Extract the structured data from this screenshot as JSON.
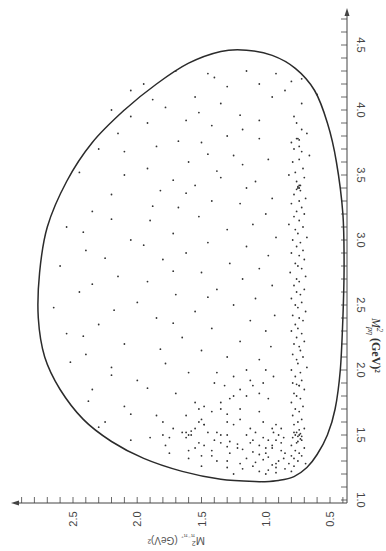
{
  "chart_data": {
    "type": "scatter",
    "title": "",
    "subtitle": "Dalitz plot (figure rotated 90°)",
    "xlabel": "M²_pη (GeV)²",
    "ylabel": "M²_π⁻π⁺ (GeV)²",
    "xlabel_display": "M",
    "xlabel_sup": "2",
    "xlabel_sub": "pη",
    "xlabel_unit": "(GeV)²",
    "ylabel_display": "M",
    "ylabel_sup": "2",
    "ylabel_sub": "π⁻π⁺",
    "ylabel_unit": "(GeV)²",
    "x_axis": {
      "min": 1.0,
      "max": 4.6,
      "ticks": [
        "1.0",
        "1.5",
        "2.0",
        "2.5",
        "3.0",
        "3.5",
        "4.0",
        "4.5"
      ],
      "tick_values": [
        1.0,
        1.5,
        2.0,
        2.5,
        3.0,
        3.5,
        4.0,
        4.5
      ],
      "minor_step": 0.1
    },
    "y_axis": {
      "min": 0.38,
      "max": 2.9,
      "ticks": [
        "0.5",
        "1.0",
        "1.5",
        "2.0",
        "2.5"
      ],
      "tick_values": [
        0.5,
        1.0,
        1.5,
        2.0,
        2.5
      ],
      "minor_step": 0.1
    },
    "grid": false,
    "legend": null,
    "annotations": [
      "Kinematic boundary curve",
      "Dense band near M²_π⁻π⁺ ≈ 0.75 (ρ⁰)",
      "Enhancement near M²_pη ≈ 1.5"
    ],
    "boundary": [
      [
        1.14,
        1.03
      ],
      [
        1.15,
        0.9
      ],
      [
        1.18,
        0.78
      ],
      [
        1.25,
        0.68
      ],
      [
        1.35,
        0.6
      ],
      [
        1.5,
        0.52
      ],
      [
        1.7,
        0.46
      ],
      [
        2.0,
        0.42
      ],
      [
        2.4,
        0.4
      ],
      [
        2.8,
        0.39
      ],
      [
        3.2,
        0.4
      ],
      [
        3.6,
        0.45
      ],
      [
        3.9,
        0.52
      ],
      [
        4.15,
        0.62
      ],
      [
        4.32,
        0.77
      ],
      [
        4.42,
        0.95
      ],
      [
        4.46,
        1.15
      ],
      [
        4.45,
        1.35
      ],
      [
        4.36,
        1.6
      ],
      [
        4.2,
        1.85
      ],
      [
        4.0,
        2.1
      ],
      [
        3.75,
        2.35
      ],
      [
        3.45,
        2.55
      ],
      [
        3.1,
        2.7
      ],
      [
        2.75,
        2.76
      ],
      [
        2.4,
        2.77
      ],
      [
        2.1,
        2.72
      ],
      [
        1.85,
        2.6
      ],
      [
        1.62,
        2.42
      ],
      [
        1.45,
        2.2
      ],
      [
        1.32,
        1.95
      ],
      [
        1.22,
        1.65
      ],
      [
        1.16,
        1.35
      ],
      [
        1.14,
        1.03
      ]
    ],
    "points": [
      [
        4.28,
        0.92
      ],
      [
        4.24,
        0.72
      ],
      [
        4.22,
        0.8
      ],
      [
        4.12,
        0.6
      ],
      [
        4.2,
        1.05
      ],
      [
        4.15,
        0.85
      ],
      [
        4.1,
        0.95
      ],
      [
        4.05,
        0.72
      ],
      [
        4.3,
        1.15
      ],
      [
        4.18,
        1.3
      ],
      [
        4.28,
        1.45
      ],
      [
        4.1,
        1.55
      ],
      [
        4.02,
        1.78
      ],
      [
        3.96,
        1.2
      ],
      [
        3.92,
        1.05
      ],
      [
        3.95,
        0.78
      ],
      [
        3.9,
        0.76
      ],
      [
        3.85,
        0.72
      ],
      [
        3.82,
        0.68
      ],
      [
        3.78,
        0.75
      ],
      [
        3.75,
        0.8
      ],
      [
        3.72,
        0.74
      ],
      [
        3.7,
        0.78
      ],
      [
        3.68,
        0.72
      ],
      [
        3.65,
        0.66
      ],
      [
        3.62,
        0.74
      ],
      [
        3.6,
        0.79
      ],
      [
        3.55,
        0.71
      ],
      [
        3.52,
        0.77
      ],
      [
        3.5,
        0.82
      ],
      [
        3.48,
        0.7
      ],
      [
        3.45,
        0.76
      ],
      [
        3.42,
        0.74
      ],
      [
        3.4,
        0.75
      ],
      [
        3.38,
        0.73
      ],
      [
        3.35,
        0.78
      ],
      [
        3.32,
        0.69
      ],
      [
        3.3,
        0.74
      ],
      [
        3.28,
        0.8
      ],
      [
        3.25,
        0.72
      ],
      [
        3.22,
        0.76
      ],
      [
        3.2,
        0.7
      ],
      [
        3.18,
        0.78
      ],
      [
        3.15,
        0.74
      ],
      [
        3.12,
        0.82
      ],
      [
        3.1,
        0.71
      ],
      [
        3.08,
        0.77
      ],
      [
        3.05,
        0.75
      ],
      [
        3.02,
        0.68
      ],
      [
        3.0,
        0.79
      ],
      [
        2.98,
        0.73
      ],
      [
        2.95,
        0.76
      ],
      [
        2.92,
        0.71
      ],
      [
        2.9,
        0.8
      ],
      [
        2.88,
        0.74
      ],
      [
        2.85,
        0.7
      ],
      [
        2.82,
        0.77
      ],
      [
        2.8,
        0.75
      ],
      [
        2.78,
        0.72
      ],
      [
        2.75,
        0.81
      ],
      [
        2.72,
        0.69
      ],
      [
        2.7,
        0.76
      ],
      [
        2.68,
        0.74
      ],
      [
        2.65,
        0.78
      ],
      [
        2.62,
        0.7
      ],
      [
        2.6,
        0.76
      ],
      [
        2.58,
        0.73
      ],
      [
        2.55,
        0.8
      ],
      [
        2.52,
        0.72
      ],
      [
        2.5,
        0.77
      ],
      [
        2.48,
        0.75
      ],
      [
        2.45,
        0.69
      ],
      [
        2.42,
        0.79
      ],
      [
        2.4,
        0.74
      ],
      [
        2.38,
        0.71
      ],
      [
        2.35,
        0.77
      ],
      [
        2.32,
        0.75
      ],
      [
        2.3,
        0.8
      ],
      [
        2.28,
        0.72
      ],
      [
        2.25,
        0.76
      ],
      [
        2.22,
        0.7
      ],
      [
        2.2,
        0.78
      ],
      [
        2.18,
        0.74
      ],
      [
        2.15,
        0.73
      ],
      [
        2.12,
        0.79
      ],
      [
        2.1,
        0.71
      ],
      [
        2.08,
        0.76
      ],
      [
        2.05,
        0.75
      ],
      [
        2.02,
        0.68
      ],
      [
        2.0,
        0.8
      ],
      [
        1.98,
        0.73
      ],
      [
        1.95,
        0.77
      ],
      [
        1.92,
        0.72
      ],
      [
        1.9,
        0.79
      ],
      [
        1.88,
        0.74
      ],
      [
        1.85,
        0.7
      ],
      [
        1.82,
        0.78
      ],
      [
        1.8,
        0.76
      ],
      [
        1.78,
        0.73
      ],
      [
        1.75,
        0.8
      ],
      [
        1.72,
        0.71
      ],
      [
        1.7,
        0.77
      ],
      [
        1.68,
        0.74
      ],
      [
        1.65,
        0.79
      ],
      [
        1.62,
        0.72
      ],
      [
        1.6,
        0.75
      ],
      [
        1.58,
        0.78
      ],
      [
        1.55,
        0.7
      ],
      [
        1.52,
        0.76
      ],
      [
        1.5,
        0.74
      ],
      [
        1.5,
        0.77
      ],
      [
        1.49,
        0.75
      ],
      [
        1.51,
        0.73
      ],
      [
        1.48,
        0.79
      ],
      [
        1.46,
        0.72
      ],
      [
        1.44,
        0.76
      ],
      [
        1.42,
        0.8
      ],
      [
        1.4,
        0.7
      ],
      [
        1.38,
        0.77
      ],
      [
        1.36,
        0.74
      ],
      [
        1.34,
        0.72
      ],
      [
        1.32,
        0.78
      ],
      [
        1.3,
        0.75
      ],
      [
        1.28,
        0.69
      ],
      [
        3.4,
        0.74
      ],
      [
        3.41,
        0.75
      ],
      [
        3.39,
        0.76
      ],
      [
        3.77,
        0.74
      ],
      [
        3.78,
        0.76
      ],
      [
        3.42,
        0.73
      ],
      [
        1.88,
        0.74
      ],
      [
        1.89,
        0.76
      ],
      [
        4.3,
        1.7
      ],
      [
        4.25,
        1.4
      ],
      [
        4.2,
        1.95
      ],
      [
        4.15,
        2.05
      ],
      [
        4.08,
        1.88
      ],
      [
        4.0,
        2.2
      ],
      [
        3.95,
        2.05
      ],
      [
        3.92,
        1.62
      ],
      [
        3.88,
        1.42
      ],
      [
        3.85,
        1.18
      ],
      [
        3.8,
        1.3
      ],
      [
        3.78,
        1.05
      ],
      [
        3.75,
        1.5
      ],
      [
        3.72,
        1.85
      ],
      [
        3.7,
        2.3
      ],
      [
        3.68,
        2.1
      ],
      [
        3.65,
        1.25
      ],
      [
        3.62,
        0.98
      ],
      [
        3.6,
        1.6
      ],
      [
        3.55,
        1.92
      ],
      [
        3.52,
        2.45
      ],
      [
        3.5,
        2.1
      ],
      [
        3.48,
        1.35
      ],
      [
        3.45,
        1.08
      ],
      [
        3.42,
        1.55
      ],
      [
        3.4,
        1.15
      ],
      [
        3.38,
        1.82
      ],
      [
        3.35,
        2.2
      ],
      [
        3.32,
        0.95
      ],
      [
        3.3,
        1.42
      ],
      [
        3.28,
        1.2
      ],
      [
        3.25,
        1.68
      ],
      [
        3.22,
        2.35
      ],
      [
        3.2,
        1.0
      ],
      [
        3.18,
        1.52
      ],
      [
        3.15,
        1.9
      ],
      [
        3.12,
        1.1
      ],
      [
        3.1,
        2.55
      ],
      [
        3.08,
        1.3
      ],
      [
        3.05,
        1.72
      ],
      [
        3.02,
        0.92
      ],
      [
        3.0,
        2.05
      ],
      [
        2.98,
        1.45
      ],
      [
        2.95,
        1.15
      ],
      [
        2.92,
        2.4
      ],
      [
        2.9,
        1.62
      ],
      [
        2.88,
        0.98
      ],
      [
        2.85,
        1.8
      ],
      [
        2.82,
        1.28
      ],
      [
        2.8,
        2.6
      ],
      [
        2.78,
        1.05
      ],
      [
        2.75,
        1.5
      ],
      [
        2.72,
        2.15
      ],
      [
        2.7,
        1.18
      ],
      [
        2.68,
        1.92
      ],
      [
        2.65,
        0.95
      ],
      [
        2.62,
        1.38
      ],
      [
        2.6,
        2.45
      ],
      [
        2.58,
        1.7
      ],
      [
        2.55,
        1.08
      ],
      [
        2.52,
        2.0
      ],
      [
        2.5,
        1.25
      ],
      [
        2.48,
        2.65
      ],
      [
        2.45,
        1.55
      ],
      [
        2.42,
        0.93
      ],
      [
        2.4,
        1.85
      ],
      [
        2.38,
        1.12
      ],
      [
        2.35,
        2.3
      ],
      [
        2.32,
        1.42
      ],
      [
        2.3,
        1.0
      ],
      [
        2.28,
        2.55
      ],
      [
        2.25,
        1.65
      ],
      [
        2.22,
        1.2
      ],
      [
        2.2,
        2.1
      ],
      [
        2.18,
        0.96
      ],
      [
        2.15,
        1.5
      ],
      [
        2.12,
        2.4
      ],
      [
        2.1,
        1.3
      ],
      [
        2.08,
        1.05
      ],
      [
        2.05,
        1.78
      ],
      [
        2.02,
        2.2
      ],
      [
        2.0,
        1.15
      ],
      [
        1.98,
        1.6
      ],
      [
        1.95,
        0.94
      ],
      [
        1.92,
        2.0
      ],
      [
        1.9,
        1.4
      ],
      [
        1.88,
        1.1
      ],
      [
        1.85,
        2.35
      ],
      [
        1.82,
        1.7
      ],
      [
        1.8,
        1.25
      ],
      [
        1.78,
        0.98
      ],
      [
        1.75,
        1.55
      ],
      [
        1.72,
        2.1
      ],
      [
        1.7,
        1.35
      ],
      [
        1.68,
        1.05
      ],
      [
        1.65,
        1.85
      ],
      [
        1.62,
        1.2
      ],
      [
        1.6,
        2.25
      ],
      [
        1.58,
        1.48
      ],
      [
        1.55,
        0.95
      ],
      [
        1.52,
        1.65
      ],
      [
        1.5,
        1.3
      ],
      [
        1.48,
        1.9
      ],
      [
        1.46,
        1.1
      ],
      [
        1.44,
        1.52
      ],
      [
        1.42,
        1.78
      ],
      [
        1.4,
        1.22
      ],
      [
        1.38,
        1.6
      ],
      [
        1.36,
        1.0
      ],
      [
        1.34,
        1.42
      ],
      [
        1.32,
        1.15
      ],
      [
        1.3,
        1.3
      ],
      [
        1.28,
        0.92
      ],
      [
        1.62,
        1.5
      ],
      [
        1.6,
        1.52
      ],
      [
        1.58,
        1.48
      ],
      [
        1.55,
        1.55
      ],
      [
        1.52,
        1.45
      ],
      [
        1.5,
        1.58
      ],
      [
        1.48,
        1.62
      ],
      [
        1.46,
        1.4
      ],
      [
        1.44,
        1.35
      ],
      [
        1.42,
        1.48
      ],
      [
        1.4,
        1.55
      ],
      [
        1.38,
        1.42
      ],
      [
        1.36,
        1.28
      ],
      [
        1.34,
        1.5
      ],
      [
        1.32,
        1.6
      ],
      [
        1.3,
        1.38
      ],
      [
        1.28,
        1.2
      ],
      [
        1.26,
        1.1
      ],
      [
        1.25,
        1.3
      ],
      [
        1.24,
        1.18
      ],
      [
        1.22,
        1.05
      ],
      [
        1.6,
        1.3
      ],
      [
        1.58,
        1.25
      ],
      [
        1.55,
        1.12
      ],
      [
        1.52,
        1.08
      ],
      [
        1.5,
        1.15
      ],
      [
        1.48,
        1.02
      ],
      [
        1.46,
        0.98
      ],
      [
        1.44,
        1.12
      ],
      [
        1.42,
        1.05
      ],
      [
        1.4,
        0.95
      ],
      [
        1.38,
        0.88
      ],
      [
        1.36,
        0.85
      ],
      [
        1.34,
        0.8
      ],
      [
        1.32,
        0.86
      ],
      [
        1.3,
        0.9
      ],
      [
        1.28,
        0.82
      ],
      [
        1.26,
        0.78
      ],
      [
        1.24,
        0.85
      ],
      [
        1.22,
        0.8
      ],
      [
        1.6,
        1.02
      ],
      [
        1.58,
        0.92
      ],
      [
        1.55,
        0.88
      ],
      [
        1.52,
        0.94
      ],
      [
        1.5,
        0.9
      ],
      [
        1.48,
        0.86
      ],
      [
        1.46,
        0.92
      ],
      [
        1.44,
        0.88
      ],
      [
        1.42,
        0.95
      ],
      [
        1.4,
        1.0
      ],
      [
        1.5,
        1.35
      ],
      [
        1.52,
        1.38
      ],
      [
        1.48,
        1.75
      ],
      [
        1.5,
        1.8
      ],
      [
        1.55,
        1.72
      ],
      [
        1.6,
        1.8
      ],
      [
        1.65,
        1.62
      ],
      [
        1.7,
        1.52
      ],
      [
        1.72,
        1.48
      ],
      [
        1.68,
        1.42
      ],
      [
        1.66,
        1.3
      ],
      [
        1.7,
        1.2
      ],
      [
        1.75,
        1.35
      ],
      [
        1.78,
        1.28
      ],
      [
        1.8,
        1.15
      ],
      [
        1.82,
        1.05
      ],
      [
        1.85,
        1.2
      ],
      [
        1.88,
        1.32
      ],
      [
        1.9,
        1.02
      ],
      [
        1.92,
        1.12
      ],
      [
        1.95,
        1.25
      ],
      [
        1.98,
        1.38
      ],
      [
        2.0,
        1.0
      ],
      [
        1.45,
        1.28
      ],
      [
        1.43,
        1.22
      ],
      [
        1.41,
        1.3
      ],
      [
        1.39,
        1.18
      ],
      [
        1.37,
        1.1
      ],
      [
        1.35,
        1.05
      ],
      [
        1.33,
        0.98
      ],
      [
        1.31,
        1.02
      ],
      [
        1.29,
        1.08
      ],
      [
        1.27,
        0.95
      ],
      [
        1.25,
        0.92
      ],
      [
        1.23,
        0.98
      ],
      [
        1.21,
        0.92
      ],
      [
        1.2,
        1.0
      ],
      [
        1.5,
        1.6
      ],
      [
        1.52,
        1.62
      ],
      [
        1.53,
        1.58
      ],
      [
        1.45,
        0.75
      ],
      [
        1.47,
        0.73
      ],
      [
        1.49,
        0.72
      ],
      [
        1.52,
        0.78
      ],
      [
        1.54,
        0.74
      ],
      [
        4.05,
        1.35
      ],
      [
        3.98,
        1.52
      ],
      [
        3.9,
        1.92
      ],
      [
        3.82,
        2.15
      ],
      [
        3.76,
        1.68
      ],
      [
        3.66,
        1.45
      ],
      [
        3.58,
        1.18
      ],
      [
        3.53,
        1.38
      ],
      [
        3.46,
        1.72
      ],
      [
        3.36,
        1.62
      ],
      [
        3.26,
        1.88
      ],
      [
        3.16,
        2.2
      ],
      [
        3.06,
        2.42
      ],
      [
        2.96,
        1.95
      ],
      [
        2.86,
        2.25
      ],
      [
        2.76,
        1.72
      ],
      [
        2.66,
        2.35
      ],
      [
        2.56,
        1.45
      ],
      [
        2.46,
        2.18
      ],
      [
        2.36,
        1.72
      ],
      [
        2.26,
        2.42
      ],
      [
        2.16,
        1.82
      ],
      [
        2.06,
        2.52
      ],
      [
        1.96,
        2.2
      ],
      [
        1.86,
        1.92
      ],
      [
        1.76,
        2.38
      ],
      [
        1.66,
        2.05
      ],
      [
        1.56,
        2.3
      ],
      [
        1.46,
        2.05
      ],
      [
        1.36,
        1.75
      ],
      [
        1.26,
        1.5
      ],
      [
        1.2,
        1.25
      ]
    ]
  },
  "plot_style": {
    "point_color": "#333333",
    "curve_color": "#2b2b2b",
    "axis_color": "#444444",
    "background": "#ffffff"
  }
}
